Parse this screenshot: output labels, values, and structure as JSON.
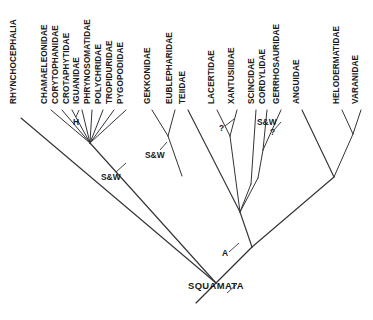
{
  "figure": {
    "type": "cladogram",
    "title": "",
    "taxa": [
      {
        "id": "rhynchocephalia",
        "label": "RHYNCHOCEPHALIA",
        "x": 16,
        "tip_y": 112
      },
      {
        "id": "chamaeleonidae",
        "label": "CHAMAELEONIDAE",
        "x": 47,
        "tip_y": 104
      },
      {
        "id": "corytophanidae",
        "label": "CORYTOPHANIDAE",
        "x": 58,
        "tip_y": 104
      },
      {
        "id": "crotaphytidae",
        "label": "CROTAPHYTIDAE",
        "x": 69,
        "tip_y": 104
      },
      {
        "id": "iguanidae",
        "label": "IGUANIDAE",
        "x": 79,
        "tip_y": 104
      },
      {
        "id": "phrynosomatidae",
        "label": "PHRYNOSOMATIDAE",
        "x": 90,
        "tip_y": 104
      },
      {
        "id": "polychridae",
        "label": "POLYCHRIDAE",
        "x": 101,
        "tip_y": 104
      },
      {
        "id": "tropiduridae",
        "label": "TROPIDURIDAE",
        "x": 112,
        "tip_y": 104
      },
      {
        "id": "pygopodidae",
        "label": "PYGOPODIDAE",
        "x": 123,
        "tip_y": 104
      },
      {
        "id": "gekkonidae",
        "label": "GEKKONIDAE",
        "x": 150,
        "tip_y": 104
      },
      {
        "id": "eublepharidae",
        "label": "EUBLEPHARIDAE",
        "x": 172,
        "tip_y": 104
      },
      {
        "id": "teiidae",
        "label": "TEIIDAE",
        "x": 185,
        "tip_y": 104
      },
      {
        "id": "lacertidae",
        "label": "LACERTIDAE",
        "x": 214,
        "tip_y": 104
      },
      {
        "id": "xantusiidae",
        "label": "XANTUSIIDAE",
        "x": 234,
        "tip_y": 104
      },
      {
        "id": "scincidae",
        "label": "SCINCIDAE",
        "x": 254,
        "tip_y": 104
      },
      {
        "id": "cordylidae",
        "label": "CORDYLIDAE",
        "x": 265,
        "tip_y": 104
      },
      {
        "id": "gerrhosauridae",
        "label": "GERRHOSAURIDAE",
        "x": 279,
        "tip_y": 104
      },
      {
        "id": "anguidae",
        "label": "ANGUIDAE",
        "x": 299,
        "tip_y": 104
      },
      {
        "id": "helodermatidae",
        "label": "HELODERMATIDAE",
        "x": 339,
        "tip_y": 104
      },
      {
        "id": "varanidae",
        "label": "VARANIDAE",
        "x": 358,
        "tip_y": 104
      }
    ],
    "node_labels": [
      {
        "id": "iguania-h",
        "label": "H",
        "x": 76,
        "y": 122
      },
      {
        "id": "iguania-sw",
        "label": "S&W",
        "x": 101,
        "y": 180
      },
      {
        "id": "gekkota-sw",
        "label": "S&W",
        "x": 145,
        "y": 158
      },
      {
        "id": "lacertid-query",
        "label": "?",
        "x": 219,
        "y": 130
      },
      {
        "id": "scincomorph-sw",
        "label": "S&W",
        "x": 257,
        "y": 125
      },
      {
        "id": "cordylid-query",
        "label": "?",
        "x": 270,
        "y": 134
      },
      {
        "id": "anguimorpha-a",
        "label": "A",
        "x": 222,
        "y": 255
      },
      {
        "id": "squamata-root",
        "label": "SQUAMATA",
        "x": 188,
        "y": 288
      }
    ],
    "legend_notes": {
      "sw": "S&W",
      "h": "H",
      "a": "A",
      "uncertain": "?"
    },
    "colors": {
      "background": "#ffffff",
      "line": "#33333a",
      "text": "#1a1a1a"
    }
  }
}
